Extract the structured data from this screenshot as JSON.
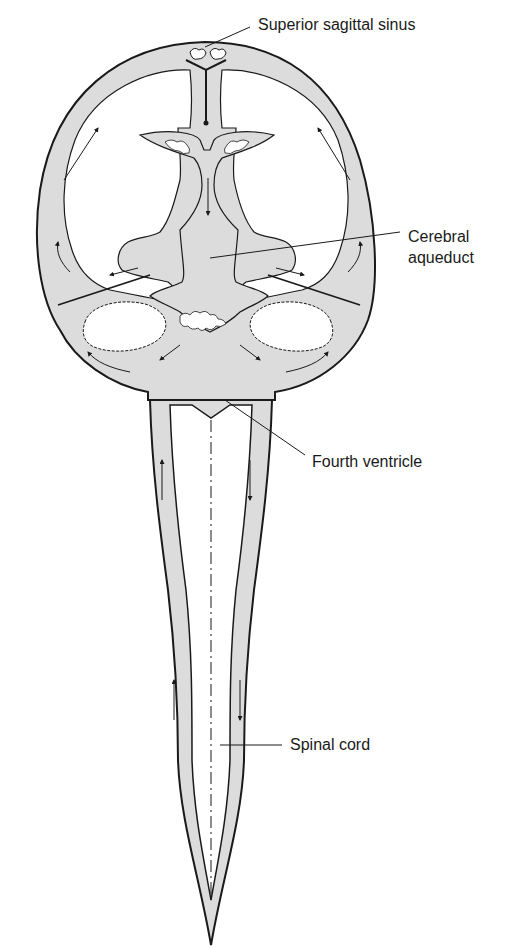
{
  "diagram": {
    "colors": {
      "csf_fill": "#dcdcdc",
      "outline": "#1a1a1a",
      "background": "#ffffff"
    },
    "labels": {
      "superior_sagittal_sinus": "Superior sagittal sinus",
      "cerebral_aqueduct_line1": "Cerebral",
      "cerebral_aqueduct_line2": "aqueduct",
      "fourth_ventricle": "Fourth ventricle",
      "spinal_cord": "Spinal cord"
    }
  }
}
